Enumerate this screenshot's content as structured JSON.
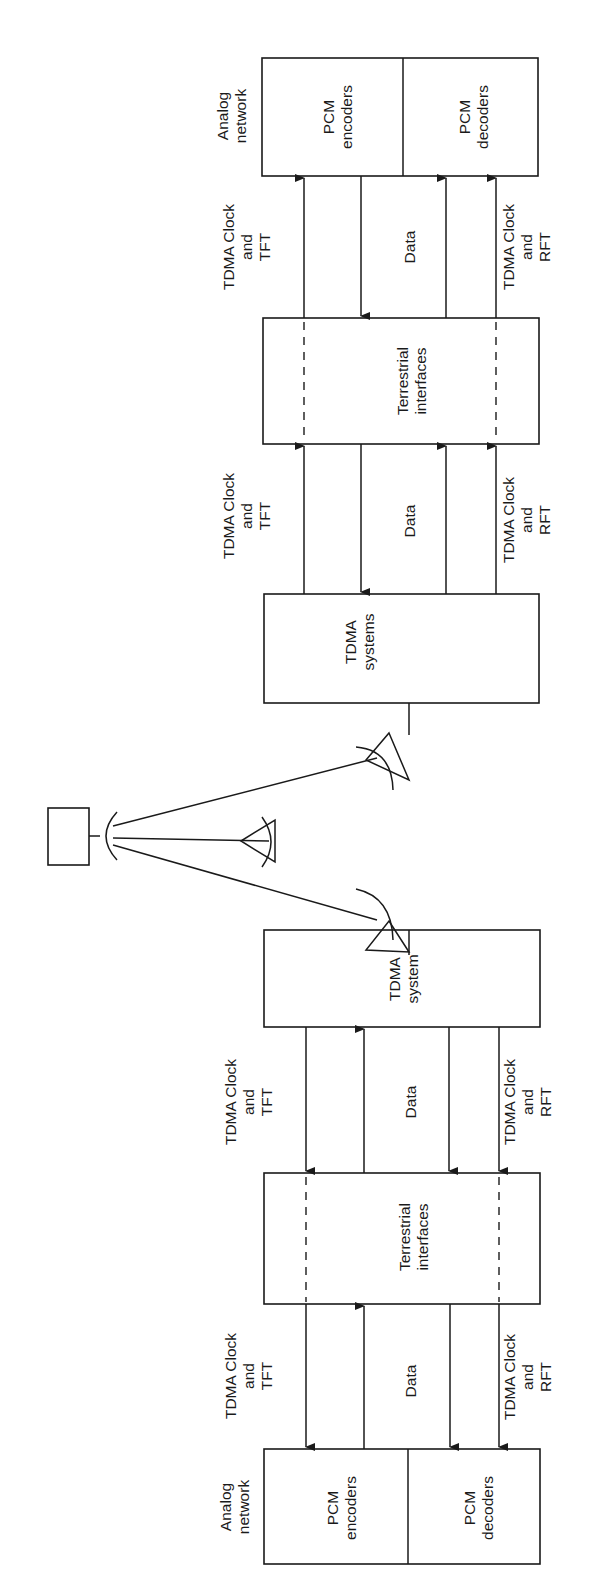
{
  "diagram": {
    "type": "block-diagram",
    "orientation": "rotated-90",
    "labels": {
      "analog_network": [
        "Analog",
        "network"
      ],
      "pcm_encoders": [
        "PCM",
        "encoders"
      ],
      "pcm_decoders": [
        "PCM",
        "decoders"
      ],
      "terrestrial_interfaces": [
        "Terrestrial",
        "interfaces"
      ],
      "tdma_systems": [
        "TDMA",
        "systems"
      ],
      "tdma_system": [
        "TDMA",
        "system"
      ],
      "clock_tft": [
        "TDMA Clock",
        "and",
        "TFT"
      ],
      "clock_rft": [
        "TDMA Clock",
        "and",
        "RFT"
      ],
      "data": "Data"
    },
    "stroke_color": "#1a1a1a",
    "background": "#ffffff"
  }
}
